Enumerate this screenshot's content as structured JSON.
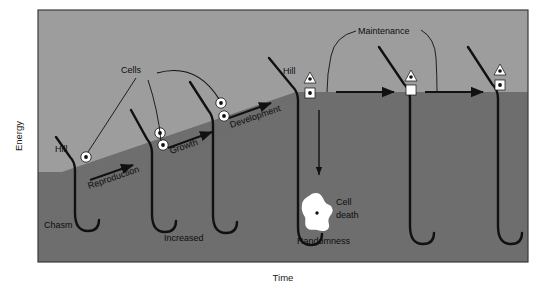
{
  "figure": {
    "type": "conceptual-energy-landscape-diagram",
    "axes": {
      "y_label": "Energy",
      "x_label": "Time"
    },
    "colors": {
      "upper_background": "#9d9d9d",
      "lower_terrain": "#6e6e6e",
      "line": "#111111",
      "cell_fill": "#ffffff",
      "cell_dot": "#111111",
      "page": "#ffffff",
      "frame": "#3a3a3a"
    },
    "labels": {
      "hill_1": "Hill",
      "chasm_1": "Chasm",
      "reproduction": "Reproduction",
      "increased": "Increased",
      "growth": "Growth",
      "development": "Development",
      "cells": "Cells",
      "hill_2": "Hill",
      "cell_death": "Cell\ndeath",
      "cell_death_line1": "Cell",
      "cell_death_line2": "death",
      "randomness": "Randomness",
      "maintenance": "Maintenance"
    },
    "stages": [
      {
        "index": 1,
        "name": "reproduction-stage",
        "hill_label": "Hill",
        "chasm_label": "Chasm",
        "arrow_label": "Reproduction",
        "cells": [
          {
            "shape": "circle",
            "dotted": true
          }
        ]
      },
      {
        "index": 2,
        "name": "growth-stage",
        "chasm_label": "Increased",
        "arrow_label": "Growth",
        "cells": [
          {
            "shape": "circle",
            "dotted": true
          },
          {
            "shape": "circle",
            "dotted": true
          }
        ]
      },
      {
        "index": 3,
        "name": "development-stage",
        "arrow_label": "Development",
        "cells": [
          {
            "shape": "circle",
            "dotted": true
          },
          {
            "shape": "circle",
            "dotted": true
          }
        ]
      },
      {
        "index": 4,
        "name": "cell-death-stage",
        "hill_label": "Hill",
        "chasm_label": "Randomness",
        "annotation": "Cell death",
        "cells": [
          {
            "shape": "triangle",
            "dotted": true
          },
          {
            "shape": "square",
            "dotted": true
          }
        ]
      },
      {
        "index": 5,
        "name": "maintenance-stage-a",
        "arrow_label": "Maintenance",
        "cells": [
          {
            "shape": "triangle",
            "dotted": true
          },
          {
            "shape": "square",
            "dotted": false
          }
        ]
      },
      {
        "index": 6,
        "name": "maintenance-stage-b",
        "cells": [
          {
            "shape": "triangle",
            "dotted": true
          },
          {
            "shape": "square",
            "dotted": true
          }
        ]
      }
    ]
  }
}
